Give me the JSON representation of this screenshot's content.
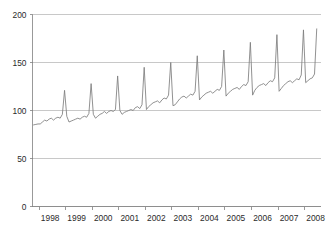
{
  "chart_data": {
    "type": "line",
    "title": "",
    "subtitle": "",
    "xlabel": "",
    "ylabel": "",
    "ylim": [
      0,
      200
    ],
    "xlim": [
      1997.75,
      2008.6
    ],
    "grid": true,
    "legend": false,
    "legend_position": "none",
    "y_ticks": [
      0,
      50,
      100,
      150,
      200
    ],
    "y_tick_labels": [
      "0",
      "50",
      "100",
      "150",
      "200"
    ],
    "x_ticks": [
      1998,
      1999,
      2000,
      2001,
      2002,
      2003,
      2004,
      2005,
      2006,
      2007,
      2008
    ],
    "x_tick_labels": [
      "1998",
      "1999",
      "2000",
      "2001",
      "2002",
      "2003",
      "2004",
      "2005",
      "2006",
      "2007",
      "2008"
    ],
    "line_color": "#7d7d7d",
    "grid_color": "#b0b0b0",
    "background_color": "#ffffff",
    "series": [
      {
        "name": "Index",
        "x": [
          1997.79,
          1997.875,
          1997.958,
          1998.042,
          1998.125,
          1998.208,
          1998.292,
          1998.375,
          1998.458,
          1998.542,
          1998.625,
          1998.708,
          1998.792,
          1998.875,
          1998.958,
          1999.042,
          1999.125,
          1999.208,
          1999.292,
          1999.375,
          1999.458,
          1999.542,
          1999.625,
          1999.708,
          1999.792,
          1999.875,
          1999.958,
          2000.042,
          2000.125,
          2000.208,
          2000.292,
          2000.375,
          2000.458,
          2000.542,
          2000.625,
          2000.708,
          2000.792,
          2000.875,
          2000.958,
          2001.042,
          2001.125,
          2001.208,
          2001.292,
          2001.375,
          2001.458,
          2001.542,
          2001.625,
          2001.708,
          2001.792,
          2001.875,
          2001.958,
          2002.042,
          2002.125,
          2002.208,
          2002.292,
          2002.375,
          2002.458,
          2002.542,
          2002.625,
          2002.708,
          2002.792,
          2002.875,
          2002.958,
          2003.042,
          2003.125,
          2003.208,
          2003.292,
          2003.375,
          2003.458,
          2003.542,
          2003.625,
          2003.708,
          2003.792,
          2003.875,
          2003.958,
          2004.042,
          2004.125,
          2004.208,
          2004.292,
          2004.375,
          2004.458,
          2004.542,
          2004.625,
          2004.708,
          2004.792,
          2004.875,
          2004.958,
          2005.042,
          2005.125,
          2005.208,
          2005.292,
          2005.375,
          2005.458,
          2005.542,
          2005.625,
          2005.708,
          2005.792,
          2005.875,
          2005.958,
          2006.042,
          2006.125,
          2006.208,
          2006.292,
          2006.375,
          2006.458,
          2006.542,
          2006.625,
          2006.708,
          2006.792,
          2006.875,
          2006.958,
          2007.042,
          2007.125,
          2007.208,
          2007.292,
          2007.375,
          2007.458,
          2007.542,
          2007.625,
          2007.708,
          2007.792,
          2007.875,
          2007.958,
          2008.042,
          2008.125,
          2008.208,
          2008.292,
          2008.375,
          2008.458
        ],
        "values": [
          85,
          85.5,
          86,
          86,
          88,
          90,
          89,
          91,
          92,
          90,
          92,
          93,
          92,
          96,
          121,
          94,
          88,
          89,
          90,
          91,
          92,
          91,
          93,
          94,
          93,
          97,
          128,
          96,
          92,
          94,
          96,
          97,
          99,
          97,
          99,
          100,
          99,
          101,
          136,
          100,
          96,
          98,
          99,
          100,
          101,
          100,
          103,
          104,
          102,
          106,
          145,
          101,
          104,
          106,
          108,
          109,
          110,
          108,
          111,
          113,
          112,
          116,
          150,
          105,
          106,
          109,
          112,
          114,
          115,
          113,
          115,
          117,
          116,
          120,
          157,
          111,
          114,
          116,
          118,
          119,
          120,
          118,
          120,
          122,
          121,
          125,
          163,
          115,
          118,
          120,
          122,
          123,
          124,
          122,
          125,
          127,
          126,
          130,
          171,
          116,
          121,
          124,
          126,
          127,
          128,
          126,
          129,
          131,
          130,
          134,
          179,
          120,
          123,
          126,
          128,
          130,
          131,
          129,
          131,
          133,
          132,
          137,
          184,
          129,
          131,
          133,
          134,
          138,
          185
        ]
      }
    ]
  }
}
